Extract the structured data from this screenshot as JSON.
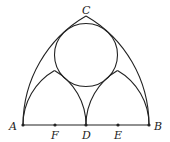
{
  "diagram": {
    "type": "geometry-figure",
    "points": {
      "A": {
        "label": "A",
        "x": 23,
        "y": 125
      },
      "F": {
        "label": "F",
        "x": 55,
        "y": 125
      },
      "D": {
        "label": "D",
        "x": 86,
        "y": 125
      },
      "E": {
        "label": "E",
        "x": 118,
        "y": 125
      },
      "B": {
        "label": "B",
        "x": 149,
        "y": 125
      },
      "C": {
        "label": "C",
        "x": 86,
        "y": 16
      }
    },
    "segments": [
      [
        "A",
        "B"
      ]
    ],
    "big_arcs": [
      {
        "center": "A",
        "radius": 126,
        "from": "B",
        "to": "C"
      },
      {
        "center": "B",
        "radius": 126,
        "from": "A",
        "to": "C"
      }
    ],
    "small_arcs": [
      {
        "center": "A",
        "radius": 63,
        "from": "D"
      },
      {
        "center": "D",
        "radius": 63,
        "from": "A"
      },
      {
        "center": "D",
        "radius": 63,
        "from": "B"
      },
      {
        "center": "B",
        "radius": 63,
        "from": "D"
      }
    ],
    "circle": {
      "cx": 86,
      "cy": 55,
      "r": 31.5
    },
    "stroke_color": "#222222"
  }
}
